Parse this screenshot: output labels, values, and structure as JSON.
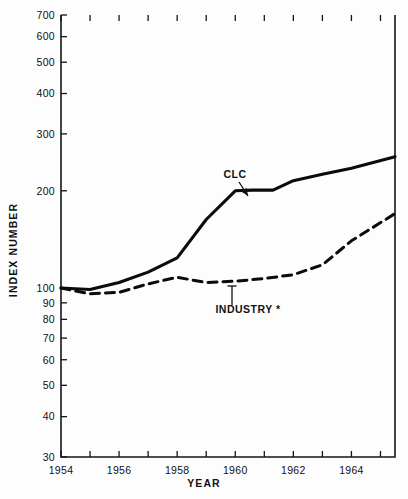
{
  "chart_data": {
    "type": "line",
    "title": "",
    "xlabel": "YEAR",
    "ylabel": "INDEX NUMBER",
    "yscale": "log",
    "ylim": [
      30,
      700
    ],
    "xlim": [
      1954,
      1965.5
    ],
    "grid": false,
    "legend": "annotations-inline",
    "ytick_labels": [
      "700",
      "600",
      "500",
      "400",
      "300",
      "200",
      "100",
      "90",
      "80",
      "70",
      "60",
      "50",
      "40",
      "30"
    ],
    "ytick_values": [
      700,
      600,
      500,
      400,
      300,
      200,
      100,
      90,
      80,
      70,
      60,
      50,
      40,
      30
    ],
    "xtick_values": [
      1954,
      1955,
      1956,
      1957,
      1958,
      1959,
      1960,
      1961,
      1962,
      1963,
      1964,
      1965
    ],
    "xtick_labels": [
      "1954",
      "",
      "1956",
      "",
      "1958",
      "",
      "1960",
      "",
      "1962",
      "",
      "1964",
      ""
    ],
    "series": [
      {
        "name": "CLC",
        "style": "solid",
        "x": [
          1954,
          1955,
          1956,
          1957,
          1958,
          1959,
          1960,
          1960.6,
          1961.3,
          1962,
          1963,
          1964,
          1965.5
        ],
        "values": [
          100,
          99,
          104,
          112,
          124,
          163,
          200,
          201,
          201,
          215,
          225,
          235,
          255
        ]
      },
      {
        "name": "INDUSTRY *",
        "style": "dashed",
        "x": [
          1954,
          1955,
          1956,
          1957,
          1958,
          1959,
          1960,
          1961,
          1962,
          1963,
          1964,
          1965.5
        ],
        "values": [
          100,
          96,
          97,
          103,
          108,
          104,
          105,
          107,
          110,
          118,
          140,
          170
        ]
      }
    ],
    "annotations": [
      {
        "text": "CLC",
        "label_x": 235,
        "label_y": 178,
        "anchor": "middle",
        "leader_from": [
          239,
          182
        ],
        "leader_to": [
          248,
          196
        ],
        "arrow": "end"
      },
      {
        "text": "INDUSTRY *",
        "label_x": 248,
        "label_y": 313,
        "anchor": "middle",
        "leader_from": [
          232,
          286
        ],
        "leader_to": [
          232,
          305
        ],
        "arrow": "start"
      }
    ]
  }
}
